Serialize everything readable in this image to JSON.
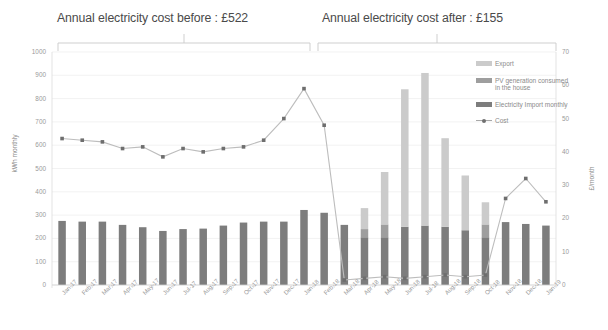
{
  "annotations": {
    "before_title": "Annual electricity cost before : £522",
    "after_title": "Annual electricity cost after : £155"
  },
  "legend": {
    "items": [
      {
        "label": "Export",
        "color": "#cbcbcb",
        "type": "bar"
      },
      {
        "label": "PV generation consumed in the house",
        "color": "#9e9e9e",
        "type": "bar"
      },
      {
        "label": "Electricity Import monthly",
        "color": "#7d7d7d",
        "type": "bar"
      },
      {
        "label": "Cost",
        "color": "#707070",
        "type": "line"
      }
    ]
  },
  "chart_data": {
    "type": "bar",
    "title": "",
    "xlabel": "",
    "ylabel": "kWh monthly",
    "y2label": "£/month",
    "ylim": [
      0,
      1000
    ],
    "y2lim": [
      0,
      70
    ],
    "yticks": [
      0,
      100,
      200,
      300,
      400,
      500,
      600,
      700,
      800,
      900,
      1000
    ],
    "y2ticks": [
      0,
      10,
      20,
      30,
      40,
      50,
      60,
      70
    ],
    "grid": true,
    "legend_position": "right",
    "stacked": true,
    "categories": [
      "Jan-17",
      "Feb-17",
      "Mar-17",
      "Apr-17",
      "May-17",
      "Jun-17",
      "Jul-17",
      "Aug-17",
      "Sep-17",
      "Oct-17",
      "Nov-17",
      "Dec-17",
      "Jan-18",
      "Feb-18",
      "Mar-18",
      "Apr-18",
      "May-18",
      "Jun-18",
      "Jul-18",
      "Aug-18",
      "Sep-18",
      "Oct-18",
      "Nov-18",
      "Dec-18",
      "Jan-19"
    ],
    "series": [
      {
        "name": "Electricity Import monthly",
        "color": "#7d7d7d",
        "axis": "left",
        "values": [
          275,
          272,
          272,
          258,
          248,
          232,
          240,
          242,
          255,
          268,
          272,
          272,
          322,
          310,
          258,
          205,
          205,
          250,
          255,
          250,
          235,
          205,
          270,
          262,
          255
        ]
      },
      {
        "name": "PV generation consumed in the house",
        "color": "#9e9e9e",
        "axis": "left",
        "values": [
          0,
          0,
          0,
          0,
          0,
          0,
          0,
          0,
          0,
          0,
          0,
          0,
          0,
          0,
          0,
          35,
          55,
          0,
          0,
          0,
          0,
          55,
          0,
          0,
          0
        ]
      },
      {
        "name": "Export",
        "color": "#cbcbcb",
        "axis": "left",
        "values": [
          0,
          0,
          0,
          0,
          0,
          0,
          0,
          0,
          0,
          0,
          0,
          0,
          0,
          0,
          0,
          90,
          225,
          590,
          655,
          380,
          235,
          95,
          0,
          0,
          0
        ]
      }
    ],
    "stack_totals": [
      275,
      272,
      272,
      258,
      248,
      232,
      240,
      242,
      255,
      268,
      272,
      272,
      322,
      310,
      258,
      330,
      485,
      840,
      910,
      630,
      470,
      355,
      270,
      262,
      255
    ],
    "cost_line": {
      "name": "Cost",
      "color": "#707070",
      "axis": "right",
      "unit": "£/month",
      "values": [
        44,
        43.5,
        43,
        41,
        41.5,
        38.5,
        41,
        40,
        41,
        41.5,
        43.5,
        50,
        59,
        48,
        1.5,
        2,
        2.5,
        2,
        2.5,
        3,
        2.5,
        3,
        26,
        32,
        25
      ]
    }
  }
}
